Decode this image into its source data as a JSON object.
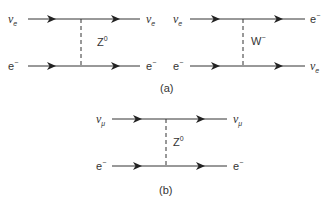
{
  "figure": {
    "panel_a": {
      "label": "(a)",
      "diagrams": [
        {
          "name": "neutral-current",
          "in_top": {
            "sym": "ν",
            "sub": "e"
          },
          "out_top": {
            "sym": "ν",
            "sub": "e"
          },
          "in_bottom": {
            "sym": "e",
            "sup": "−"
          },
          "out_bottom": {
            "sym": "e",
            "sup": "−"
          },
          "boson": {
            "sym": "Z",
            "sup": "0"
          }
        },
        {
          "name": "charged-current",
          "in_top": {
            "sym": "ν",
            "sub": "e"
          },
          "out_top": {
            "sym": "e",
            "sup": "−"
          },
          "in_bottom": {
            "sym": "e",
            "sup": "−"
          },
          "out_bottom": {
            "sym": "ν",
            "sub": "e"
          },
          "boson": {
            "sym": "W",
            "sup": "−"
          }
        }
      ]
    },
    "panel_b": {
      "label": "(b)",
      "diagram": {
        "name": "muon-neutrino-neutral-current",
        "in_top": {
          "sym": "ν",
          "sub": "μ"
        },
        "out_top": {
          "sym": "ν",
          "sub": "μ"
        },
        "in_bottom": {
          "sym": "e",
          "sup": "−"
        },
        "out_bottom": {
          "sym": "e",
          "sup": "−"
        },
        "boson": {
          "sym": "Z",
          "sup": "0"
        }
      }
    }
  }
}
